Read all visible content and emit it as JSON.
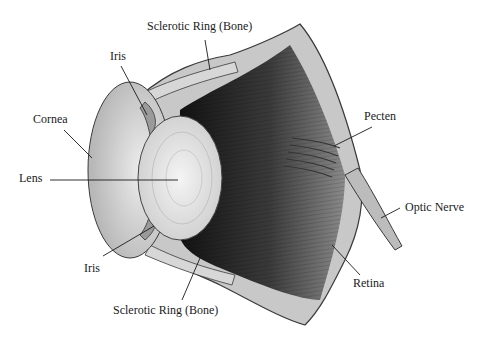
{
  "figure": {
    "labels": {
      "sclerotic_ring_top": "Sclerotic Ring (Bone)",
      "iris_top": "Iris",
      "cornea": "Cornea",
      "lens": "Lens",
      "iris_bottom": "Iris",
      "sclerotic_ring_bottom": "Sclerotic Ring (Bone)",
      "pecten": "Pecten",
      "optic_nerve": "Optic Nerve",
      "retina": "Retina"
    }
  },
  "colors": {
    "background": "#ffffff",
    "outline": "#3a3a3a",
    "cornea": "#d9d9d9",
    "lens": "#e6e6e6",
    "interior_dark": "#1e1e1e",
    "sclera": "#bdbdbd",
    "label_text": "#1a1a1a"
  }
}
